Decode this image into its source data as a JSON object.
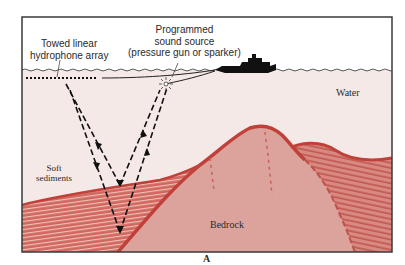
{
  "figure": {
    "panel_label": "A",
    "labels": {
      "hydrophone": [
        "Towed linear",
        "hydrophone array"
      ],
      "sound_source": [
        "Programmed",
        "sound source",
        "(pressure gun or sparker)"
      ],
      "water": "Water",
      "soft_sediments": [
        "Soft",
        "sediments"
      ],
      "bedrock": "Bedrock"
    },
    "colors": {
      "frame": "#3a3a3a",
      "air": "#ffffff",
      "water": "#f4e9e7",
      "sediment_top": "#c8504a",
      "sediment_stripe_light": "#eab8b0",
      "bedrock": "#dca39c",
      "bedrock_edge": "#c0403a",
      "ray": "#1a1a1a",
      "ship": "#111111"
    }
  }
}
